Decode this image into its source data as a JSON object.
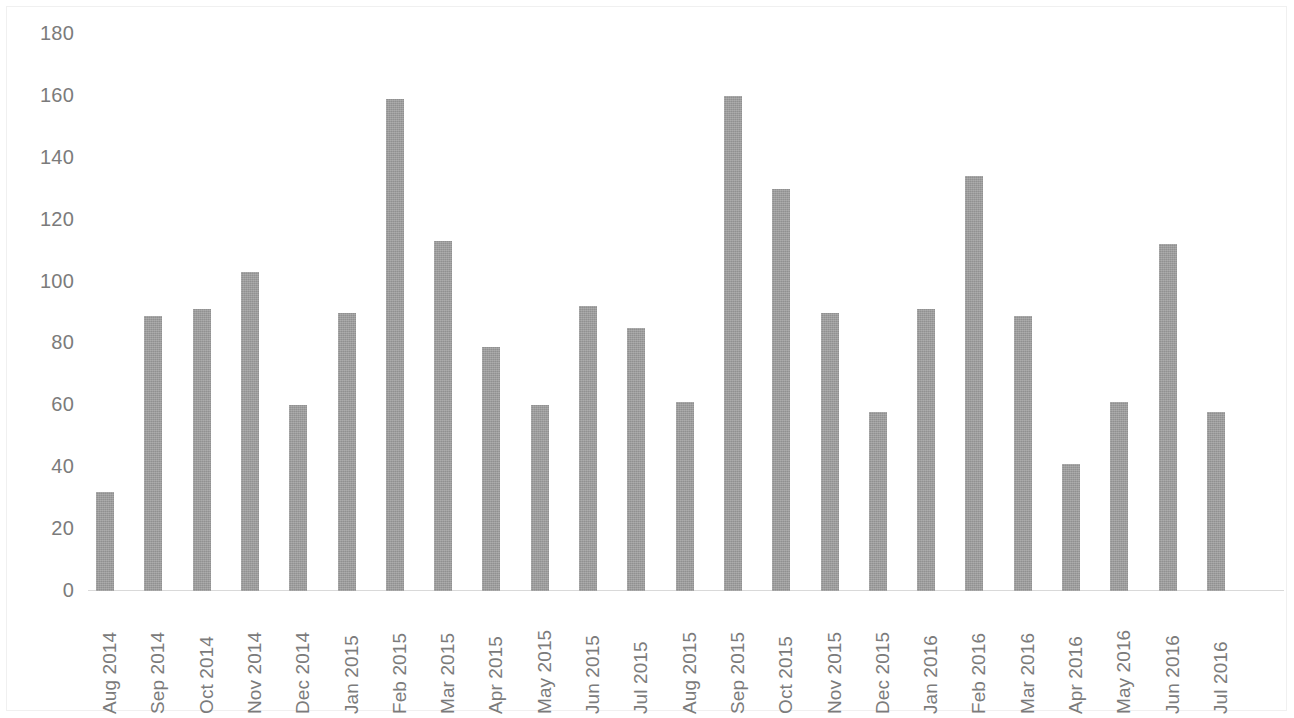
{
  "chart_data": {
    "type": "bar",
    "title": "",
    "subtitle": "",
    "xlabel": "",
    "ylabel": "",
    "ylim": [
      0,
      180
    ],
    "ytick_step": 20,
    "yticks": [
      "180",
      "160",
      "140",
      "120",
      "100",
      "80",
      "60",
      "40",
      "20",
      "0"
    ],
    "grid": false,
    "legend": null,
    "bar_color": "#9c9c9c",
    "axis_text_color": "#7b7b7b",
    "axis_line_color": "#d9d9d9",
    "categories": [
      "Aug 2014",
      "Sep 2014",
      "Oct 2014",
      "Nov 2014",
      "Dec 2014",
      "Jan 2015",
      "Feb 2015",
      "Mar 2015",
      "Apr 2015",
      "May 2015",
      "Jun 2015",
      "Jul 2015",
      "Aug 2015",
      "Sep 2015",
      "Oct 2015",
      "Nov 2015",
      "Dec 2015",
      "Jan 2016",
      "Feb 2016",
      "Mar 2016",
      "Apr 2016",
      "May 2016",
      "Jun 2016",
      "Jul 2016"
    ],
    "values": [
      32,
      89,
      91,
      103,
      60,
      90,
      159,
      113,
      79,
      60,
      92,
      85,
      61,
      160,
      130,
      90,
      58,
      91,
      134,
      89,
      41,
      61,
      112,
      58
    ]
  }
}
